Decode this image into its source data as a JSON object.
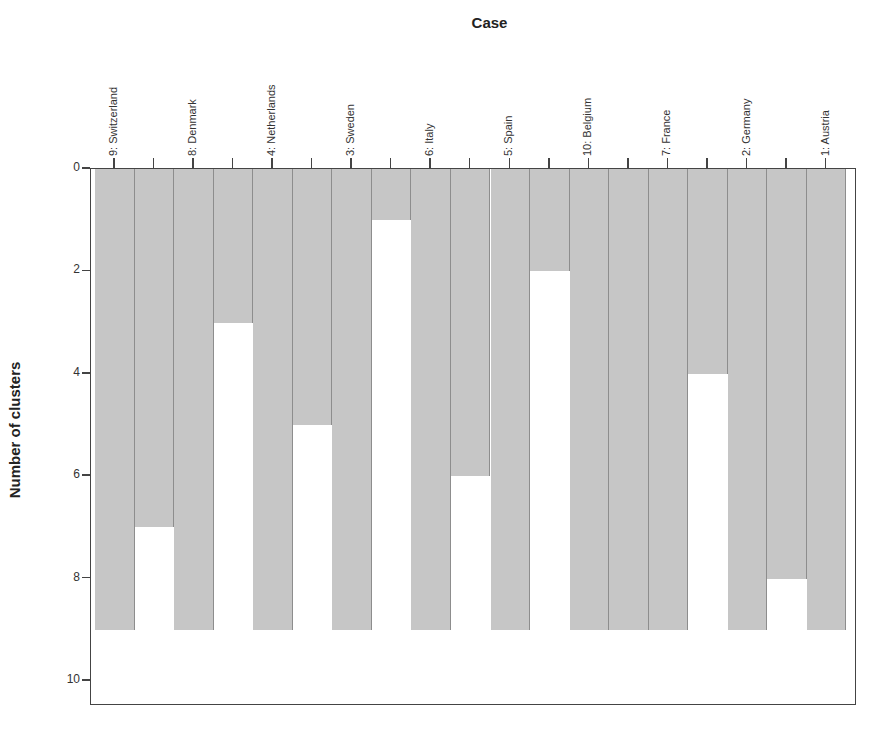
{
  "chart_data": {
    "type": "icicle",
    "title": "Case",
    "xlabel": "Case",
    "ylabel": "Number of clusters",
    "ylim": [
      0,
      10
    ],
    "yticks": [
      0,
      2,
      4,
      6,
      8,
      10
    ],
    "orientation": "vertical",
    "cases": [
      "9: Switzerland",
      "8: Denmark",
      "4: Netherlands",
      "3: Sweden",
      "6: Italy",
      "5: Spain",
      "10: Belgium",
      "7: France",
      "2: Germany",
      "1: Austria"
    ],
    "case_bar_depth": 9,
    "join_depths": [
      {
        "between": [
          "9: Switzerland",
          "8: Denmark"
        ],
        "value": 7
      },
      {
        "between": [
          "8: Denmark",
          "4: Netherlands"
        ],
        "value": 3
      },
      {
        "between": [
          "4: Netherlands",
          "3: Sweden"
        ],
        "value": 5
      },
      {
        "between": [
          "3: Sweden",
          "6: Italy"
        ],
        "value": 1
      },
      {
        "between": [
          "6: Italy",
          "5: Spain"
        ],
        "value": 6
      },
      {
        "between": [
          "5: Spain",
          "10: Belgium"
        ],
        "value": 2
      },
      {
        "between": [
          "10: Belgium",
          "7: France"
        ],
        "value": 9
      },
      {
        "between": [
          "7: France",
          "2: Germany"
        ],
        "value": 4
      },
      {
        "between": [
          "2: Germany",
          "1: Austria"
        ],
        "value": 8
      }
    ],
    "grid": false,
    "legend": null,
    "bar_color": "#c6c6c6",
    "background": "#ffffff"
  }
}
